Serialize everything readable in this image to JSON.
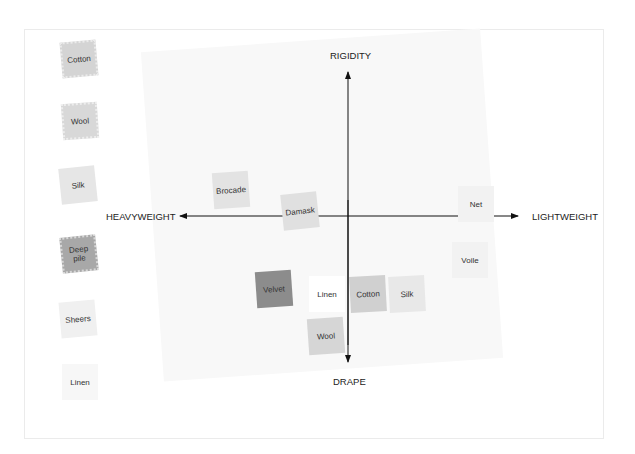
{
  "axes": {
    "top": "RIGIDITY",
    "bottom": "DRAPE",
    "left": "HEAVYWEIGHT",
    "right": "LIGHTWEIGHT"
  },
  "legend": [
    {
      "label": "Cotton",
      "color": "#d4d4d4",
      "pinked": true
    },
    {
      "label": "Wool",
      "color": "#d8d8d8",
      "pinked": true
    },
    {
      "label": "Silk",
      "color": "#e6e6e6",
      "pinked": false
    },
    {
      "label": "Deep pile",
      "color": "#a8a8a8",
      "pinked": true
    },
    {
      "label": "Sheers",
      "color": "#f0f0f0",
      "pinked": false
    },
    {
      "label": "Linen",
      "color": "#f7f7f7",
      "pinked": false
    }
  ],
  "plotted": [
    {
      "label": "Brocade",
      "color": "#e3e3e3",
      "x": 213,
      "y": 172,
      "rot": -4
    },
    {
      "label": "Damask",
      "color": "#e0e0e0",
      "x": 282,
      "y": 193,
      "rot": -6
    },
    {
      "label": "Net",
      "color": "#f2f2f2",
      "x": 458,
      "y": 186,
      "rot": 0
    },
    {
      "label": "Voile",
      "color": "#f2f2f2",
      "x": 452,
      "y": 242,
      "rot": 0
    },
    {
      "label": "Velvet",
      "color": "#8c8c8c",
      "x": 256,
      "y": 271,
      "rot": -4
    },
    {
      "label": "Linen",
      "color": "#ffffff",
      "x": 309,
      "y": 276,
      "rot": 0
    },
    {
      "label": "Cotton",
      "color": "#d0d0d0",
      "x": 350,
      "y": 276,
      "rot": -3
    },
    {
      "label": "Silk",
      "color": "#e8e8e8",
      "x": 389,
      "y": 276,
      "rot": -3
    },
    {
      "label": "Wool",
      "color": "#d6d6d6",
      "x": 308,
      "y": 318,
      "rot": -4
    }
  ]
}
